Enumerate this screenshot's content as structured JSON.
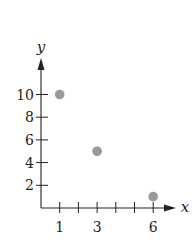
{
  "chart_data": {
    "type": "scatter",
    "title": "",
    "xlabel": "x",
    "ylabel": "y",
    "x": [
      1,
      3,
      6
    ],
    "y": [
      10,
      5,
      1
    ],
    "points": [
      {
        "x": 1,
        "y": 10
      },
      {
        "x": 3,
        "y": 5
      },
      {
        "x": 6,
        "y": 1
      }
    ],
    "x_ticks": [
      1,
      2,
      3,
      4,
      5,
      6
    ],
    "x_tick_labels": [
      "1",
      "",
      "3",
      "",
      "",
      "6"
    ],
    "y_ticks": [
      2,
      4,
      6,
      8,
      10
    ],
    "y_tick_labels": [
      "2",
      "4",
      "6",
      "8",
      "10"
    ],
    "xlim": [
      0,
      7
    ],
    "ylim": [
      0,
      12
    ],
    "grid": false,
    "legend": null,
    "point_color": "#999999",
    "axis_color": "#222222"
  }
}
